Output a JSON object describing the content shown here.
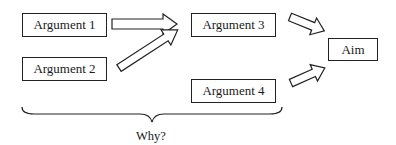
{
  "diagram": {
    "nodes": [
      {
        "id": "arg1",
        "label": "Argument 1"
      },
      {
        "id": "arg2",
        "label": "Argument 2"
      },
      {
        "id": "arg3",
        "label": "Argument 3"
      },
      {
        "id": "arg4",
        "label": "Argument 4"
      },
      {
        "id": "aim",
        "label": "Aim"
      }
    ],
    "edges": [
      {
        "from": "arg1",
        "to": "arg3"
      },
      {
        "from": "arg2",
        "to": "arg3"
      },
      {
        "from": "arg3",
        "to": "aim"
      },
      {
        "from": "arg4",
        "to": "aim"
      }
    ],
    "brace": {
      "spans": [
        "arg1",
        "arg2",
        "arg3",
        "arg4"
      ],
      "label": "Why?"
    }
  }
}
